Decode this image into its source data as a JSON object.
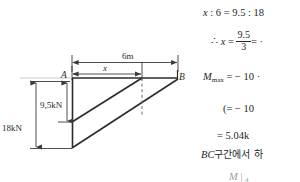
{
  "figure": {
    "name": "shear-force-diagram",
    "span_label": "6m",
    "distance_label": "x",
    "left_node": "A",
    "right_node": "B",
    "inner_force_label": "9,5kN",
    "outer_force_label": "18kN",
    "colors": {
      "line": "#2b2b2b",
      "dimension": "#3a3a3a",
      "dashed": "#6a6a6a",
      "text": "#23262b"
    },
    "geometry": {
      "beam_left_x": 72,
      "beam_right_x": 178,
      "beam_top_y": 78,
      "beam_bottom_y": 148,
      "section_x": 142,
      "zero_crossing_y": 122
    }
  },
  "solution": {
    "line1": "x : 6 = 9.5 : 18",
    "line1_parts": {
      "lhs_var": "x",
      "lhs_value": "6",
      "rhs_value_1": "9.5",
      "rhs_value_2": "18"
    },
    "line2_prefix": "∴",
    "line2_var": "x",
    "line2_eq": "=",
    "line2_num": "9.5",
    "line2_den": "3",
    "line2_tail": "= ·",
    "line3": "M",
    "line3_sub": "max",
    "line3_tail": "= − 10 ·",
    "line4": "(= − 10",
    "line5": "= 5.04k",
    "line6": "BC구간에서 하",
    "line6_italic": "BC",
    "line6_kr": "구간에서 하",
    "line7_left": "M",
    "line7_right": "| ₄"
  }
}
